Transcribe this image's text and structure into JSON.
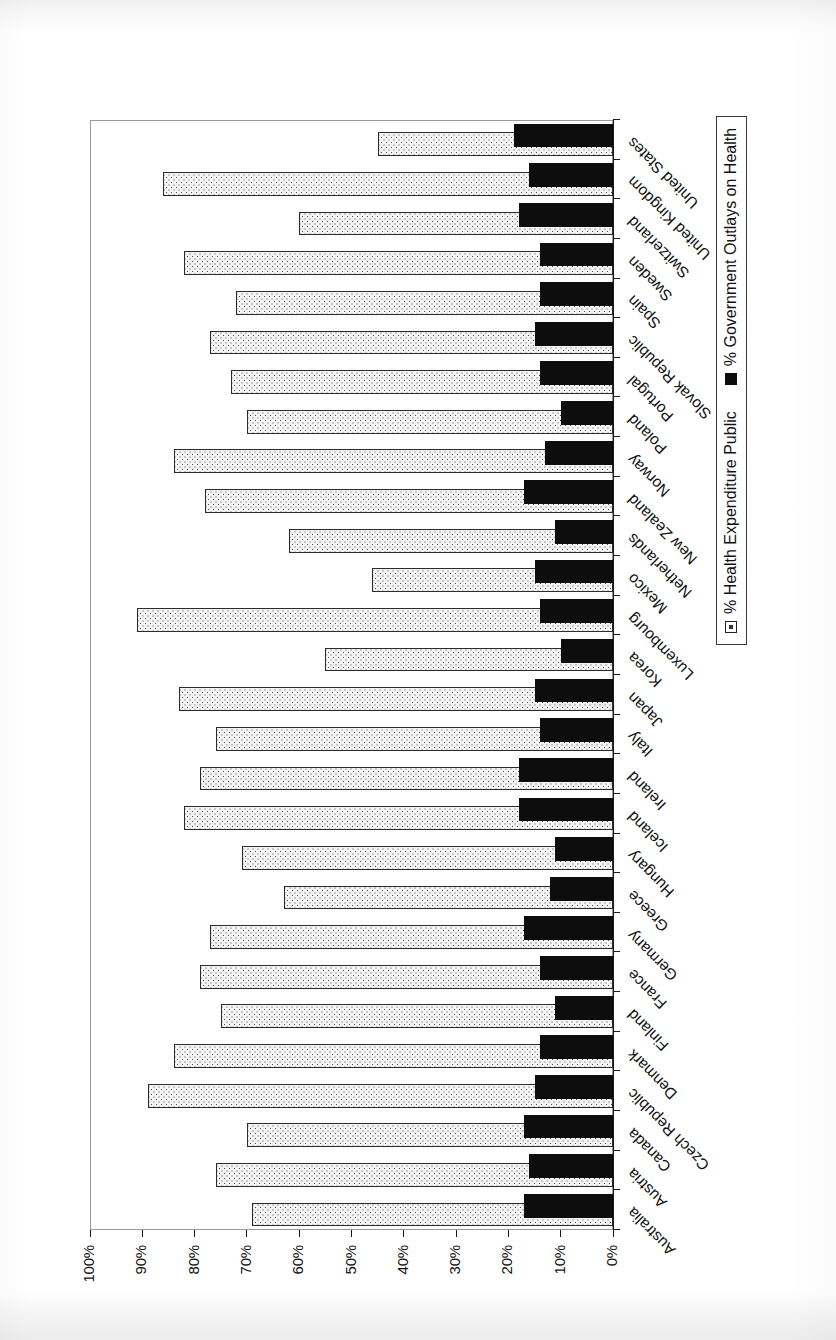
{
  "chart_data": {
    "type": "bar",
    "orientation": "horizontal-printed-rotated",
    "title": "",
    "xlabel": "",
    "ylabel": "",
    "ylim": [
      0,
      100
    ],
    "value_axis_ticks": [
      "0%",
      "10%",
      "20%",
      "30%",
      "40%",
      "50%",
      "60%",
      "70%",
      "80%",
      "90%",
      "100%"
    ],
    "value_axis_tick_values": [
      0,
      10,
      20,
      30,
      40,
      50,
      60,
      70,
      80,
      90,
      100
    ],
    "grid": false,
    "legend_position": "bottom-right",
    "categories": [
      "Australia",
      "Austria",
      "Canada",
      "Czech Republic",
      "Denmark",
      "Finland",
      "France",
      "Germany",
      "Greece",
      "Hungary",
      "Iceland",
      "Ireland",
      "Italy",
      "Japan",
      "Korea",
      "Luxembourg",
      "Mexico",
      "Netherlands",
      "New Zealand",
      "Norway",
      "Poland",
      "Portugal",
      "Slovak Republic",
      "Spain",
      "Sweden",
      "Switzerland",
      "United Kingdom",
      "United States"
    ],
    "series": [
      {
        "name": "% Health Expenditure Public",
        "marker": "dotted-hollow",
        "values": [
          69,
          76,
          70,
          89,
          84,
          75,
          79,
          77,
          63,
          71,
          82,
          79,
          76,
          83,
          55,
          91,
          46,
          62,
          78,
          84,
          70,
          73,
          77,
          72,
          82,
          60,
          86,
          45
        ]
      },
      {
        "name": "% Government Outlays on Health",
        "marker": "solid-black",
        "values": [
          17,
          16,
          17,
          15,
          14,
          11,
          14,
          17,
          12,
          11,
          18,
          18,
          14,
          15,
          10,
          14,
          15,
          11,
          17,
          13,
          10,
          14,
          15,
          14,
          14,
          18,
          16,
          19
        ]
      }
    ]
  },
  "legend": {
    "items": [
      {
        "label": "% Health Expenditure Public",
        "swatch": "hollow-dotted-square"
      },
      {
        "label": "% Government Outlays on Health",
        "swatch": "black-square"
      }
    ]
  },
  "figure": {
    "frame_color": "#9a9a9a",
    "bar_public_fill": "#f4f4f4",
    "bar_public_border": "#2b2b2b",
    "bar_gov_fill": "#0d0d0d",
    "axis_color": "#1a1a1a",
    "text_color": "#111111"
  }
}
